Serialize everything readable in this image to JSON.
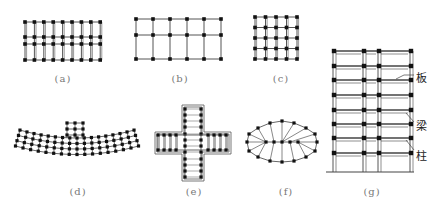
{
  "figure": {
    "panels": [
      {
        "id": "a",
        "label": "(a)",
        "description": "rectangular grid plan, 9 columns x 4 rows of nodes"
      },
      {
        "id": "b",
        "label": "(b)",
        "description": "rectangular frame plan, 6 columns x 3 rows of nodes"
      },
      {
        "id": "c",
        "label": "(c)",
        "description": "square grid plan, 5 x 5 nodes"
      },
      {
        "id": "d",
        "label": "(d)",
        "description": "curved (arc-shaped) grid plan with central projection"
      },
      {
        "id": "e",
        "label": "(e)",
        "description": "cross-shaped plan"
      },
      {
        "id": "f",
        "label": "(f)",
        "description": "elliptical radial plan"
      },
      {
        "id": "g",
        "label": "(g)",
        "description": "frame building elevation"
      }
    ],
    "annotations": {
      "slab": "板",
      "beam": "梁",
      "column": "柱"
    },
    "colors": {
      "line": "#444444",
      "node": "#111111",
      "label": "#777777"
    }
  }
}
